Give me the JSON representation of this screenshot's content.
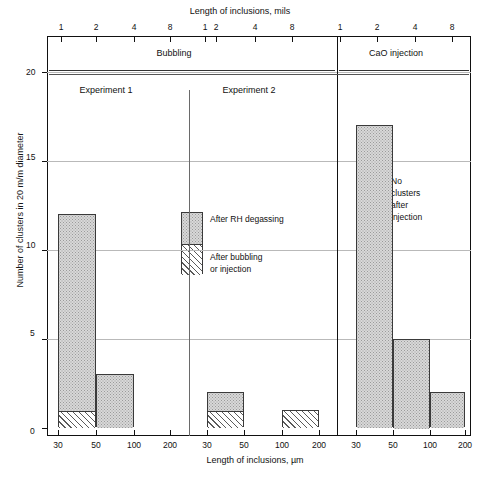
{
  "chart_data": {
    "type": "bar",
    "title": "",
    "top_axis_label": "Length of inclusions, mils",
    "bottom_axis_label": "Length of inclusions, µm",
    "ylabel": "Number of clusters in 20 m/m diameter",
    "ylim": [
      0,
      20
    ],
    "ytick_labels": [
      "0",
      "5",
      "10",
      "15",
      "20"
    ],
    "ytick_values": [
      0,
      5,
      10,
      15,
      20
    ],
    "grid": true,
    "legend_position": "inside-center",
    "xscale": "log",
    "bottom_tick_labels": [
      "30",
      "50",
      "100",
      "200"
    ],
    "top_tick_labels": [
      "1",
      "2",
      "4",
      "8"
    ],
    "group_headers": [
      {
        "label": "Bubbling",
        "spans": [
          "Experiment 1",
          "Experiment 2"
        ]
      },
      {
        "label": "CaO injection",
        "spans": []
      }
    ],
    "panels": [
      {
        "name": "Experiment 1",
        "group": "Bubbling",
        "categories": [
          "30-50",
          "50-100",
          "100-200"
        ],
        "series": [
          {
            "name": "After RH degassing",
            "pattern": "stipple",
            "values": [
              11,
              3,
              0
            ]
          },
          {
            "name": "After bubbling or injection",
            "pattern": "hatch",
            "values": [
              1,
              0,
              0
            ]
          }
        ],
        "totals": [
          12,
          3,
          0
        ]
      },
      {
        "name": "Experiment 2",
        "group": "Bubbling",
        "categories": [
          "30-50",
          "50-100",
          "100-200"
        ],
        "series": [
          {
            "name": "After RH degassing",
            "pattern": "stipple",
            "values": [
              1,
              0,
              0
            ]
          },
          {
            "name": "After bubbling or injection",
            "pattern": "hatch",
            "values": [
              1,
              0,
              1
            ]
          }
        ],
        "totals": [
          2,
          0,
          1
        ]
      },
      {
        "name": "CaO injection",
        "group": "CaO injection",
        "categories": [
          "30-50",
          "50-100",
          "100-200"
        ],
        "series": [
          {
            "name": "After RH degassing",
            "pattern": "stipple",
            "values": [
              17,
              5,
              2
            ]
          },
          {
            "name": "After bubbling or injection",
            "pattern": "hatch",
            "values": [
              0,
              0,
              0
            ]
          }
        ],
        "totals": [
          17,
          5,
          2
        ],
        "annotation": "No clusters after injection"
      }
    ],
    "legend": [
      {
        "label": "After RH degassing",
        "pattern": "stipple"
      },
      {
        "label": "After bubbling or injection",
        "pattern": "hatch"
      }
    ]
  },
  "axes": {
    "top_title": "Length of inclusions, mils",
    "bottom_title": "Length of inclusions, µm",
    "y_title": "Number of clusters in 20 m/m diameter"
  },
  "ytick_labels": [
    "20",
    "15",
    "10",
    "5",
    "0"
  ],
  "top_ticks": [
    "1",
    "2",
    "4",
    "8",
    "1",
    "2",
    "4",
    "8",
    "1",
    "2",
    "4",
    "8"
  ],
  "bottom_ticks": [
    "30",
    "50",
    "100",
    "200",
    "30",
    "50",
    "100",
    "200",
    "30",
    "50",
    "100",
    "200"
  ],
  "headers": {
    "bubbling": "Bubbling",
    "cao": "CaO injection",
    "exp1": "Experiment 1",
    "exp2": "Experiment 2"
  },
  "legend": {
    "top_label": "After RH degassing",
    "bottom_label_line1": "After bubbling",
    "bottom_label_line2": "or injection"
  },
  "annotation": {
    "line1": "No",
    "line2": "clusters",
    "line3": "after",
    "line4": "injection"
  },
  "colors": {
    "stipple_fill": "#d8d8d8",
    "stipple_dot": "#9a9a9a",
    "hatch_line": "#5a5a5a",
    "bar_border": "#3a3a3a",
    "frame": "#111111",
    "grid": "#b9b9b9"
  }
}
